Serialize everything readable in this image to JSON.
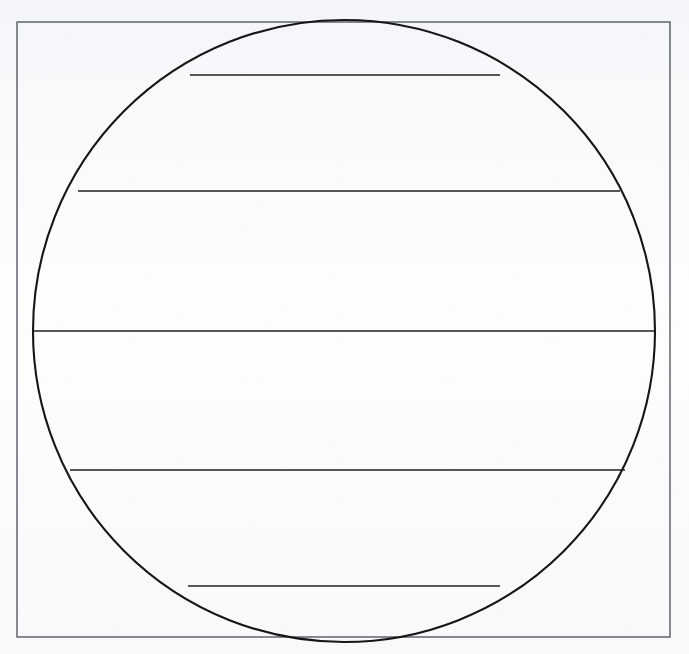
{
  "document": {
    "kind": "scanned-geometric-figure",
    "caption": "",
    "page_width": 689,
    "page_height": 654,
    "background_color": "#fbfbfd",
    "ink_color": "#1a1a1a"
  },
  "figure": {
    "title": "",
    "frame": {
      "label": "bounding-rectangle",
      "x": 17,
      "y": 22,
      "width": 653,
      "height": 615,
      "stroke": "#555a63",
      "stroke_width": 1.4,
      "fill": "none"
    },
    "circle": {
      "label": "circle",
      "center_x": 344,
      "center_y": 331,
      "radius": 311,
      "top_y": 38,
      "bottom_y": 625,
      "left_x": 33,
      "right_x": 655,
      "stroke": "#161616",
      "stroke_width": 2.1,
      "fill": "none"
    },
    "chords": [
      {
        "label": "chord-1",
        "y": 75,
        "x1": 190,
        "x2": 500,
        "length": 310,
        "stroke": "#1f1f1f",
        "stroke_width": 1.5
      },
      {
        "label": "chord-2",
        "y": 191,
        "x1": 78,
        "x2": 620,
        "length": 542,
        "stroke": "#1f1f1f",
        "stroke_width": 1.5
      },
      {
        "label": "chord-3-diameter",
        "y": 331,
        "x1": 33,
        "x2": 655,
        "length": 622,
        "stroke": "#1f1f1f",
        "stroke_width": 1.6
      },
      {
        "label": "chord-4",
        "y": 470,
        "x1": 70,
        "x2": 625,
        "length": 555,
        "stroke": "#1f1f1f",
        "stroke_width": 1.5
      },
      {
        "label": "chord-5",
        "y": 586,
        "x1": 188,
        "x2": 500,
        "length": 312,
        "stroke": "#1f1f1f",
        "stroke_width": 1.5
      }
    ],
    "chord_count": 5
  }
}
